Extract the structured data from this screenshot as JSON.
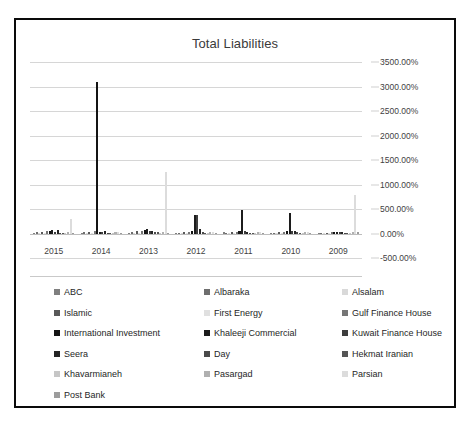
{
  "chart_data": {
    "type": "bar",
    "title": "Total Liabilities",
    "xlabel": "",
    "ylabel": "",
    "ylim": [
      -500,
      3500
    ],
    "ytick_step": 500,
    "ytick_labels": [
      "3500.00%",
      "3000.00%",
      "2500.00%",
      "2000.00%",
      "1500.00%",
      "1000.00%",
      "500.00%",
      "0.00%",
      "-500.00%"
    ],
    "ytick_values": [
      3500,
      3000,
      2500,
      2000,
      1500,
      1000,
      500,
      0,
      -500
    ],
    "grid": true,
    "legend_position": "bottom",
    "categories": [
      "2015",
      "2014",
      "2013",
      "2012",
      "2011",
      "2010",
      "2009"
    ],
    "series": [
      {
        "name": "ABC",
        "color": "#7f7f7f",
        "values": [
          18,
          12,
          20,
          15,
          22,
          14,
          10
        ]
      },
      {
        "name": "Albaraka",
        "color": "#6e6e6e",
        "values": [
          24,
          28,
          26,
          18,
          16,
          20,
          14
        ]
      },
      {
        "name": "Alsalam",
        "color": "#d9d9d9",
        "values": [
          10,
          14,
          12,
          10,
          12,
          10,
          8
        ]
      },
      {
        "name": "Islamic",
        "color": "#595959",
        "values": [
          30,
          34,
          44,
          26,
          24,
          28,
          18
        ]
      },
      {
        "name": "First Energy",
        "color": "#e0e0e0",
        "values": [
          8,
          10,
          9,
          8,
          10,
          7,
          6
        ]
      },
      {
        "name": "Gulf Finance House",
        "color": "#767676",
        "values": [
          46,
          52,
          60,
          40,
          34,
          38,
          24
        ]
      },
      {
        "name": "International Investment",
        "color": "#141414",
        "values": [
          55,
          3100,
          70,
          48,
          44,
          50,
          30
        ]
      },
      {
        "name": "Khaleeji Commercial",
        "color": "#1c1c1c",
        "values": [
          62,
          40,
          96,
          380,
          480,
          420,
          36
        ]
      },
      {
        "name": "Kuwait Finance House",
        "color": "#3d3d3d",
        "values": [
          40,
          30,
          52,
          370,
          60,
          52,
          28
        ]
      },
      {
        "name": "Seera",
        "color": "#242424",
        "values": [
          72,
          44,
          58,
          90,
          40,
          44,
          26
        ]
      },
      {
        "name": "Day",
        "color": "#4a4a4a",
        "values": [
          20,
          18,
          30,
          22,
          20,
          24,
          18
        ]
      },
      {
        "name": "Hekmat Iranian",
        "color": "#555555",
        "values": [
          16,
          14,
          22,
          18,
          16,
          18,
          14
        ]
      },
      {
        "name": "Khavarmianeh",
        "color": "#c6c6c6",
        "values": [
          12,
          10,
          16,
          14,
          12,
          14,
          12
        ]
      },
      {
        "name": "Pasargad",
        "color": "#b0b0b0",
        "values": [
          26,
          22,
          34,
          28,
          24,
          30,
          22
        ]
      },
      {
        "name": "Parsian",
        "color": "#dcdcdc",
        "values": [
          300,
          26,
          1250,
          30,
          26,
          34,
          780
        ]
      },
      {
        "name": "Post Bank",
        "color": "#9c9c9c",
        "values": [
          14,
          12,
          20,
          16,
          14,
          18,
          40
        ]
      }
    ]
  },
  "legend": {
    "rows": [
      [
        "ABC",
        "Albaraka",
        "Alsalam"
      ],
      [
        "Islamic",
        "First Energy",
        "Gulf Finance House"
      ],
      [
        "International Investment",
        "Khaleeji Commercial",
        "Kuwait Finance House"
      ],
      [
        "Seera",
        "Day",
        "Hekmat Iranian"
      ],
      [
        "Khavarmianeh",
        "Pasargad",
        "Parsian"
      ],
      [
        "Post Bank"
      ]
    ]
  }
}
